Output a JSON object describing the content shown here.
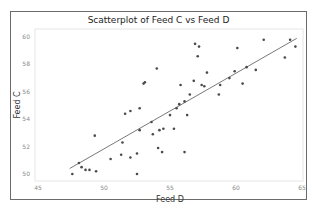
{
  "chart_data": {
    "type": "scatter",
    "title": "Scatterplot of Feed C vs Feed D",
    "xlabel": "Feed D",
    "ylabel": "Feed C",
    "xlim": [
      45,
      65
    ],
    "ylim": [
      49.6,
      60.5
    ],
    "xticks": [
      45,
      50,
      55,
      60,
      65
    ],
    "yticks": [
      50,
      52,
      54,
      56,
      58,
      60
    ],
    "grid": false,
    "legend": null,
    "series": [
      {
        "name": "Feed C vs Feed D",
        "points": [
          [
            47.6,
            50.0
          ],
          [
            48.1,
            50.8
          ],
          [
            48.3,
            50.5
          ],
          [
            48.6,
            50.3
          ],
          [
            48.9,
            50.3
          ],
          [
            49.4,
            50.2
          ],
          [
            49.3,
            52.8
          ],
          [
            50.5,
            51.1
          ],
          [
            51.3,
            51.4
          ],
          [
            51.4,
            52.3
          ],
          [
            51.6,
            54.4
          ],
          [
            52.0,
            51.2
          ],
          [
            52.0,
            54.6
          ],
          [
            52.5,
            50.0
          ],
          [
            52.5,
            51.5
          ],
          [
            52.7,
            53.2
          ],
          [
            52.7,
            54.8
          ],
          [
            53.0,
            56.6
          ],
          [
            53.1,
            56.7
          ],
          [
            53.6,
            53.8
          ],
          [
            53.7,
            52.9
          ],
          [
            54.0,
            57.7
          ],
          [
            54.1,
            51.9
          ],
          [
            54.4,
            51.6
          ],
          [
            54.2,
            53.2
          ],
          [
            54.5,
            53.3
          ],
          [
            55.0,
            54.3
          ],
          [
            55.3,
            53.3
          ],
          [
            55.5,
            54.8
          ],
          [
            55.7,
            55.1
          ],
          [
            55.8,
            56.5
          ],
          [
            56.1,
            55.3
          ],
          [
            56.1,
            51.6
          ],
          [
            56.3,
            54.3
          ],
          [
            56.5,
            55.8
          ],
          [
            56.8,
            56.8
          ],
          [
            56.9,
            59.5
          ],
          [
            57.2,
            59.3
          ],
          [
            57.1,
            58.6
          ],
          [
            57.4,
            56.5
          ],
          [
            57.6,
            56.4
          ],
          [
            57.8,
            57.4
          ],
          [
            58.7,
            55.8
          ],
          [
            58.8,
            56.5
          ],
          [
            59.5,
            57.0
          ],
          [
            59.9,
            57.5
          ],
          [
            60.1,
            59.2
          ],
          [
            60.5,
            56.6
          ],
          [
            60.8,
            57.8
          ],
          [
            61.5,
            57.6
          ],
          [
            62.1,
            59.8
          ],
          [
            63.7,
            58.5
          ],
          [
            64.1,
            59.8
          ],
          [
            64.5,
            59.3
          ]
        ]
      }
    ],
    "fit_line": {
      "x": [
        47.4,
        64.6
      ],
      "y": [
        50.4,
        59.9
      ]
    },
    "colors": {
      "points": "#4a4a4a",
      "line": "#555555",
      "frame": "#6b6b6b",
      "plot_border": "#e6e6e6"
    }
  }
}
